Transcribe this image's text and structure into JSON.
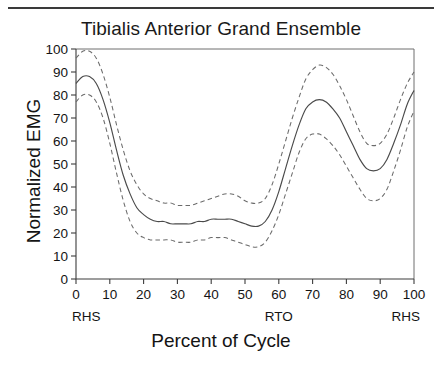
{
  "figure": {
    "title": "Tibialis Anterior   Grand Ensemble",
    "top_rule": true
  },
  "axes": {
    "ylabel": "Normalized EMG",
    "xlabel": "Percent of Cycle",
    "yticks": [
      0,
      10,
      20,
      30,
      40,
      50,
      60,
      70,
      80,
      90,
      100
    ],
    "xticks": [
      0,
      10,
      20,
      30,
      40,
      50,
      60,
      70,
      80,
      90,
      100
    ],
    "ylim": [
      0,
      100
    ],
    "xlim": [
      0,
      100
    ]
  },
  "event_labels": [
    {
      "text": "RHS",
      "at": 0,
      "align": "start"
    },
    {
      "text": "RTO",
      "at": 60,
      "align": "middle"
    },
    {
      "text": "RHS",
      "at": 100,
      "align": "end"
    }
  ],
  "colors": {
    "mean_curve": "#4a4a4a",
    "band_curve": "#6b6b6b",
    "axis": "#3d3d3d",
    "frame": "#6e6e6e",
    "text": "#141414",
    "rule": "#3a3a3a",
    "background": "#ffffff"
  },
  "chart_data": {
    "type": "line",
    "title": "Tibialis Anterior   Grand Ensemble",
    "xlabel": "Percent of Cycle",
    "ylabel": "Normalized EMG",
    "xlim": [
      0,
      100
    ],
    "ylim": [
      0,
      100
    ],
    "grid": false,
    "legend": "none",
    "annotations": [
      {
        "text": "RHS",
        "x": 0
      },
      {
        "text": "RTO",
        "x": 60
      },
      {
        "text": "RHS",
        "x": 100
      }
    ],
    "x": [
      0,
      2,
      4,
      6,
      8,
      10,
      12,
      14,
      16,
      18,
      20,
      22,
      24,
      26,
      28,
      30,
      32,
      34,
      36,
      38,
      40,
      42,
      44,
      46,
      48,
      50,
      52,
      54,
      56,
      58,
      60,
      62,
      64,
      66,
      68,
      70,
      72,
      74,
      76,
      78,
      80,
      82,
      84,
      86,
      88,
      90,
      92,
      94,
      96,
      98,
      100
    ],
    "series": [
      {
        "name": "Upper band (+1 SD)",
        "style": "dashed",
        "values": [
          96,
          99,
          99,
          96,
          89,
          79,
          67,
          56,
          47,
          41,
          37,
          35,
          34,
          33,
          33,
          32,
          32,
          32,
          33,
          34,
          35,
          36,
          37,
          37,
          36,
          34,
          33,
          33,
          35,
          41,
          50,
          60,
          70,
          79,
          87,
          91,
          93,
          92,
          89,
          84,
          78,
          71,
          64,
          59,
          58,
          59,
          63,
          70,
          78,
          85,
          90
        ]
      },
      {
        "name": "Mean",
        "style": "solid",
        "values": [
          85,
          88,
          88,
          85,
          78,
          68,
          56,
          45,
          37,
          31,
          28,
          26,
          25,
          25,
          24,
          24,
          24,
          24,
          25,
          25,
          26,
          26,
          26,
          26,
          25,
          24,
          23,
          23,
          25,
          30,
          38,
          48,
          58,
          67,
          74,
          77,
          78,
          77,
          74,
          70,
          64,
          58,
          52,
          48,
          47,
          48,
          52,
          59,
          67,
          76,
          82
        ]
      },
      {
        "name": "Lower band (-1 SD)",
        "style": "dashed",
        "values": [
          77,
          80,
          80,
          77,
          70,
          59,
          46,
          34,
          25,
          20,
          18,
          17,
          17,
          17,
          17,
          16,
          16,
          16,
          17,
          17,
          18,
          18,
          18,
          17,
          16,
          15,
          14,
          14,
          16,
          21,
          28,
          37,
          46,
          55,
          61,
          63,
          63,
          61,
          58,
          54,
          49,
          44,
          39,
          35,
          34,
          35,
          39,
          47,
          56,
          66,
          73
        ]
      }
    ]
  }
}
